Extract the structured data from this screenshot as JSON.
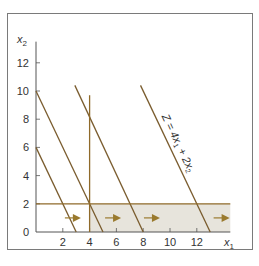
{
  "chart_data": {
    "type": "line",
    "title": "",
    "xlabel": "x1",
    "ylabel": "x2",
    "xlim": [
      0,
      14.5
    ],
    "ylim": [
      0,
      13.5
    ],
    "x_ticks": [
      2,
      4,
      6,
      8,
      10,
      12
    ],
    "y_ticks": [
      0,
      2,
      4,
      6,
      8,
      10,
      12
    ],
    "x_tick_labels": [
      "2",
      "4",
      "6",
      "8",
      "10",
      "12"
    ],
    "y_tick_labels": [
      "0",
      "2",
      "4",
      "6",
      "8",
      "10",
      "12"
    ],
    "grid": false,
    "colors": {
      "line": "#7a5c2e",
      "constraint": "#8f6a2a",
      "shade": "#e7e4dc",
      "arrow": "#9a7a2e",
      "frame": "#7a7a7a"
    },
    "series": [
      {
        "name": "Z line 1",
        "points": [
          [
            0,
            6
          ],
          [
            3,
            0
          ]
        ]
      },
      {
        "name": "Z line 2",
        "points": [
          [
            0,
            10
          ],
          [
            5,
            0
          ]
        ]
      },
      {
        "name": "Z line 3",
        "points": [
          [
            2.9,
            10.4
          ],
          [
            8,
            0
          ]
        ]
      },
      {
        "name": "Z = 4x1 + 2x2",
        "points": [
          [
            7.8,
            10.4
          ],
          [
            13,
            0
          ]
        ]
      },
      {
        "name": "x1 = 4",
        "points": [
          [
            4,
            0
          ],
          [
            4,
            9.7
          ]
        ]
      },
      {
        "name": "x2 = 2",
        "points": [
          [
            0,
            2
          ],
          [
            14.5,
            2
          ]
        ]
      }
    ],
    "shaded_region": {
      "x": [
        4,
        14.5
      ],
      "y": [
        0,
        2
      ]
    },
    "arrows": [
      {
        "x": 2.2,
        "y": 1,
        "dir": "right"
      },
      {
        "x": 6.2,
        "y": 1,
        "dir": "right"
      },
      {
        "x": 12,
        "y": 1,
        "dir": "right"
      },
      {
        "x": 9,
        "y": 1,
        "dir": "right"
      },
      {
        "x": 14,
        "y": 1,
        "dir": "right"
      }
    ],
    "annotations": [
      {
        "text": "Z = 4x1 + 2x2",
        "x": 10.5,
        "y": 7
      }
    ]
  },
  "labels": {
    "x_axis": "x",
    "x_axis_sub": "1",
    "y_axis": "x",
    "y_axis_sub": "2",
    "objective": "Z = 4x",
    "objective_sub1": "1",
    "objective_mid": " + 2x",
    "objective_sub2": "2"
  }
}
